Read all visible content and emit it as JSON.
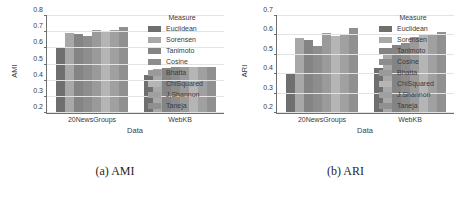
{
  "figure": {
    "subfigures": [
      {
        "caption": "(a) AMI",
        "chart_data": {
          "type": "bar",
          "title": "",
          "xlabel": "Data",
          "ylabel": "AMI",
          "ylim": [
            0.2,
            0.8
          ],
          "yticks": [
            0.2,
            0.3,
            0.4,
            0.5,
            0.6,
            0.7,
            0.8
          ],
          "ytick_labels": [
            "0.2",
            "0.3",
            "0.4",
            "0.5",
            "0.6",
            "0.7",
            "0.8"
          ],
          "grid": true,
          "legend_title": "Measure",
          "legend_position": "right",
          "categories": [
            "20NewsGroups",
            "WebKB"
          ],
          "series": [
            {
              "name": "Euclidean",
              "values": [
                0.601,
                0.433
              ]
            },
            {
              "name": "Sorensen",
              "values": [
                0.694,
                0.474
              ]
            },
            {
              "name": "Tanimoto",
              "values": [
                0.687,
                0.477
              ]
            },
            {
              "name": "Cosine",
              "values": [
                0.677,
                0.487
              ]
            },
            {
              "name": "Bhatta",
              "values": [
                0.714,
                0.487
              ]
            },
            {
              "name": "ChiSquared",
              "values": [
                0.701,
                0.486
              ]
            },
            {
              "name": "J.Shannon",
              "values": [
                0.711,
                0.487
              ]
            },
            {
              "name": "Taneja",
              "values": [
                0.731,
                0.487
              ]
            }
          ]
        }
      },
      {
        "caption": "(b) ARI",
        "chart_data": {
          "type": "bar",
          "title": "",
          "xlabel": "Data",
          "ylabel": "ARI",
          "ylim": [
            0.2,
            0.7
          ],
          "yticks": [
            0.2,
            0.3,
            0.4,
            0.5,
            0.6,
            0.7
          ],
          "ytick_labels": [
            "0.2",
            "0.3",
            "0.4",
            "0.5",
            "0.6",
            "0.7"
          ],
          "grid": true,
          "legend_title": "Measure",
          "legend_position": "right",
          "categories": [
            "20NewsGroups",
            "WebKB"
          ],
          "series": [
            {
              "name": "Euclidean",
              "values": [
                0.4,
                0.434
              ]
            },
            {
              "name": "Sorensen",
              "values": [
                0.586,
                0.525
              ]
            },
            {
              "name": "Tanimoto",
              "values": [
                0.577,
                0.553
              ]
            },
            {
              "name": "Cosine",
              "values": [
                0.548,
                0.56
              ]
            },
            {
              "name": "Bhatta",
              "values": [
                0.612,
                0.592
              ]
            },
            {
              "name": "ChiSquared",
              "values": [
                0.597,
                0.6
              ]
            },
            {
              "name": "J.Shannon",
              "values": [
                0.607,
                0.607
              ]
            },
            {
              "name": "Taneja",
              "values": [
                0.636,
                0.62
              ]
            }
          ]
        }
      }
    ],
    "colors": {
      "series": [
        "#6f6f6f",
        "#a8a8a8",
        "#848484",
        "#8d8d8d",
        "#9a9a9a",
        "#b5b5b5",
        "#a0a0a0",
        "#909090"
      ],
      "grid": "#e3e3e3",
      "axis": "#6e6e6e",
      "text": "#3a3a3a"
    }
  }
}
